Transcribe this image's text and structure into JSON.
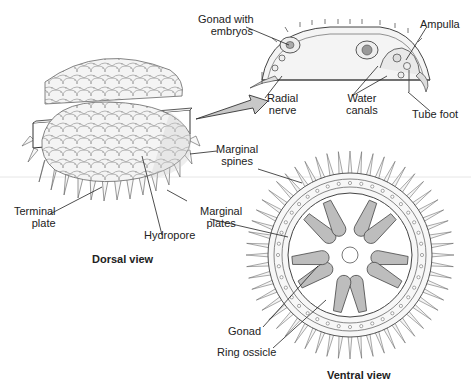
{
  "figure": {
    "views": {
      "dorsal": "Dorsal view",
      "ventral": "Ventral view"
    },
    "labels": {
      "gonad_with_embryos_1": "Gonad with",
      "gonad_with_embryos_2": "embryos",
      "radial_nerve_1": "Radial",
      "radial_nerve_2": "nerve",
      "water_canals_1": "Water",
      "water_canals_2": "canals",
      "ampulla": "Ampulla",
      "tube_foot": "Tube foot",
      "marginal_spines_1": "Marginal",
      "marginal_spines_2": "spines",
      "terminal_plate_1": "Terminal",
      "terminal_plate_2": "plate",
      "marginal_plates_1": "Marginal",
      "marginal_plates_2": "plates",
      "hydropore": "Hydropore",
      "gonad": "Gonad",
      "ring_ossicle": "Ring ossicle"
    },
    "colors": {
      "line": "#333333",
      "fill_light": "#f2f2f2",
      "fill_mid": "#d9d9d9",
      "fill_gonad": "#bfbfbf",
      "arrow": "#c8c8c8",
      "divider": "#e6e6e6"
    }
  }
}
